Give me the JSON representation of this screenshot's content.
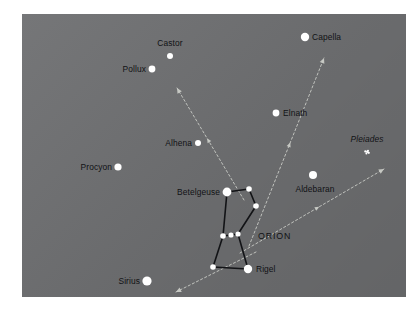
{
  "panel": {
    "background_color": "#6f7072",
    "page_background": "#ffffff",
    "star_color": "#ffffff",
    "label_color": "#111215",
    "guide_line_color": "#c9cbc6",
    "constellation_line_color": "#121316",
    "left": 22,
    "top": 14,
    "width": 384,
    "height": 283
  },
  "chart_data": {
    "type": "scatter",
    "title": "",
    "subtitle": "",
    "xlabel": "",
    "ylabel": "",
    "grid": false,
    "legend_position": "none",
    "xlim": [
      0,
      384
    ],
    "ylim": [
      0,
      283
    ],
    "stars": [
      {
        "name": "Castor",
        "x": 170,
        "y": 56,
        "r": 3.0,
        "label": "Castor",
        "label_side": "above",
        "label_dx": 0,
        "label_dy": -9,
        "italic": false
      },
      {
        "name": "Pollux",
        "x": 152,
        "y": 69,
        "r": 3.4,
        "label": "Pollux",
        "label_side": "left",
        "label_dx": -6,
        "label_dy": 0,
        "italic": false
      },
      {
        "name": "Capella",
        "x": 305,
        "y": 37,
        "r": 4.2,
        "label": "Capella",
        "label_side": "right",
        "label_dx": 7,
        "label_dy": 0,
        "italic": false
      },
      {
        "name": "Elnath",
        "x": 276,
        "y": 113,
        "r": 3.4,
        "label": "Elnath",
        "label_side": "right",
        "label_dx": 7,
        "label_dy": 0,
        "italic": false
      },
      {
        "name": "Pleiades",
        "x": 367,
        "y": 152,
        "r": 2.6,
        "label": "Pleiades",
        "label_side": "above",
        "label_dx": 0,
        "label_dy": -9,
        "italic": true
      },
      {
        "name": "Aldebaran",
        "x": 313,
        "y": 175,
        "r": 4.0,
        "label": "Aldebaran",
        "label_side": "below",
        "label_dx": 2,
        "label_dy": 10,
        "italic": false
      },
      {
        "name": "Alhena",
        "x": 198,
        "y": 143,
        "r": 3.0,
        "label": "Alhena",
        "label_side": "left",
        "label_dx": -6,
        "label_dy": 0,
        "italic": false
      },
      {
        "name": "Procyon",
        "x": 118,
        "y": 167,
        "r": 3.6,
        "label": "Procyon",
        "label_side": "left",
        "label_dx": -6,
        "label_dy": 0,
        "italic": false
      },
      {
        "name": "Betelgeuse",
        "x": 227,
        "y": 192,
        "r": 4.4,
        "label": "Betelgeuse",
        "label_side": "left",
        "label_dx": -7,
        "label_dy": 0,
        "italic": false
      },
      {
        "name": "Sirius",
        "x": 147,
        "y": 281,
        "r": 4.6,
        "label": "Sirius",
        "label_side": "left",
        "label_dx": -7,
        "label_dy": 0,
        "italic": false
      },
      {
        "name": "Rigel",
        "x": 248,
        "y": 269,
        "r": 4.2,
        "label": "Rigel",
        "label_side": "right",
        "label_dx": 8,
        "label_dy": 0,
        "italic": false
      },
      {
        "name": "Bellatrix",
        "x": 249,
        "y": 189,
        "r": 2.8,
        "label": "",
        "label_side": "none",
        "label_dx": 0,
        "label_dy": 0,
        "italic": false
      },
      {
        "name": "OrionEast",
        "x": 256,
        "y": 206,
        "r": 2.8,
        "label": "",
        "label_side": "none",
        "label_dx": 0,
        "label_dy": 0,
        "italic": false
      },
      {
        "name": "Alnitak",
        "x": 238,
        "y": 234,
        "r": 2.6,
        "label": "",
        "label_side": "none",
        "label_dx": 0,
        "label_dy": 0,
        "italic": false
      },
      {
        "name": "Alnilam",
        "x": 231,
        "y": 235,
        "r": 2.6,
        "label": "",
        "label_side": "none",
        "label_dx": 0,
        "label_dy": 0,
        "italic": false
      },
      {
        "name": "Mintaka",
        "x": 223,
        "y": 236,
        "r": 2.8,
        "label": "",
        "label_side": "none",
        "label_dx": 0,
        "label_dy": 0,
        "italic": false
      },
      {
        "name": "Saiph",
        "x": 213,
        "y": 267,
        "r": 2.8,
        "label": "",
        "label_side": "none",
        "label_dx": 0,
        "label_dy": 0,
        "italic": false
      }
    ],
    "constellation_name": "ORION",
    "constellation_label": {
      "x": 258,
      "y": 236
    },
    "constellation_lines": [
      {
        "from": "Betelgeuse",
        "to": "Bellatrix"
      },
      {
        "from": "Bellatrix",
        "to": "OrionEast"
      },
      {
        "from": "OrionEast",
        "to": "Alnitak"
      },
      {
        "from": "Betelgeuse",
        "to": "Mintaka"
      },
      {
        "from": "Mintaka",
        "to": "Alnilam"
      },
      {
        "from": "Alnilam",
        "to": "Alnitak"
      },
      {
        "from": "Mintaka",
        "to": "Saiph"
      },
      {
        "from": "Alnitak",
        "to": "Rigel"
      },
      {
        "from": "Saiph",
        "to": "Rigel"
      }
    ],
    "guide_lines": [
      {
        "name": "to-pollux",
        "x1": 222,
        "y1": 186,
        "x2": 155,
        "y2": 74,
        "arrow_end": true,
        "arrow_mid": true
      },
      {
        "name": "to-capella",
        "x1": 227,
        "y1": 232,
        "x2": 302,
        "y2": 44,
        "arrow_end": true,
        "arrow_mid": true
      },
      {
        "name": "to-pleiades",
        "x1": 218,
        "y1": 239,
        "x2": 362,
        "y2": 155,
        "arrow_end": true,
        "arrow_mid": true
      },
      {
        "name": "to-sirius",
        "x1": 234,
        "y1": 238,
        "x2": 154,
        "y2": 278,
        "arrow_end": true,
        "arrow_mid": false
      }
    ]
  }
}
